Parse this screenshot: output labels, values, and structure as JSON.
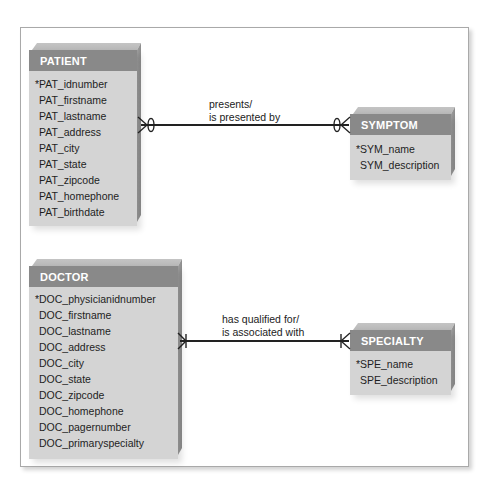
{
  "diagram": {
    "type": "entity-relationship",
    "notation": "crows-foot",
    "colors": {
      "header_bg": "#898989",
      "header_text": "#ffffff",
      "body_bg": "#d4d4d4",
      "line": "#222222",
      "frame_border": "#a9a9a9"
    },
    "entities": [
      {
        "name": "PATIENT",
        "attributes": [
          {
            "label": "PAT_idnumber",
            "pk": true
          },
          {
            "label": "PAT_firstname",
            "pk": false
          },
          {
            "label": "PAT_lastname",
            "pk": false
          },
          {
            "label": "PAT_address",
            "pk": false
          },
          {
            "label": "PAT_city",
            "pk": false
          },
          {
            "label": "PAT_state",
            "pk": false
          },
          {
            "label": "PAT_zipcode",
            "pk": false
          },
          {
            "label": "PAT_homephone",
            "pk": false
          },
          {
            "label": "PAT_birthdate",
            "pk": false
          }
        ]
      },
      {
        "name": "SYMPTOM",
        "attributes": [
          {
            "label": "SYM_name",
            "pk": true
          },
          {
            "label": "SYM_description",
            "pk": false
          }
        ]
      },
      {
        "name": "DOCTOR",
        "attributes": [
          {
            "label": "DOC_physicianidnumber",
            "pk": true
          },
          {
            "label": "DOC_firstname",
            "pk": false
          },
          {
            "label": "DOC_lastname",
            "pk": false
          },
          {
            "label": "DOC_address",
            "pk": false
          },
          {
            "label": "DOC_city",
            "pk": false
          },
          {
            "label": "DOC_state",
            "pk": false
          },
          {
            "label": "DOC_zipcode",
            "pk": false
          },
          {
            "label": "DOC_homephone",
            "pk": false
          },
          {
            "label": "DOC_pagernumber",
            "pk": false
          },
          {
            "label": "DOC_primaryspecialty",
            "pk": false
          }
        ]
      },
      {
        "name": "SPECIALTY",
        "attributes": [
          {
            "label": "SPE_name",
            "pk": true
          },
          {
            "label": "SPE_description",
            "pk": false
          }
        ]
      }
    ],
    "pk_marker": "*",
    "relationships": [
      {
        "from": "PATIENT",
        "to": "SYMPTOM",
        "label_line1": "presents/",
        "label_line2": "is presented by",
        "from_end": "zero-or-many",
        "to_end": "zero-or-many"
      },
      {
        "from": "DOCTOR",
        "to": "SPECIALTY",
        "label_line1": "has qualified for/",
        "label_line2": "is associated with",
        "from_end": "one-or-many",
        "to_end": "one-or-many"
      }
    ]
  }
}
